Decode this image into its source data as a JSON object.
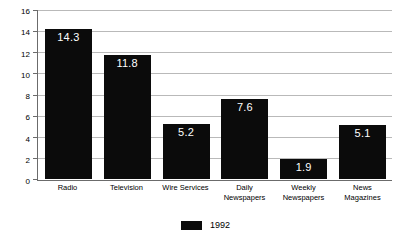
{
  "chart_data": {
    "type": "bar",
    "title": "",
    "subtitle": "",
    "xlabel": "",
    "ylabel": "",
    "categories": [
      "Radio",
      "Television",
      "Wire Services",
      "Daily Newspapers",
      "Weekly Newspapers",
      "News Magazines"
    ],
    "category_lines": [
      [
        "Radio"
      ],
      [
        "Television"
      ],
      [
        "Wire Services"
      ],
      [
        "Daily",
        "Newspapers"
      ],
      [
        "Weekly",
        "Newspapers"
      ],
      [
        "News",
        "Magazines"
      ]
    ],
    "series": [
      {
        "name": "1992",
        "color": "#0b0b0b",
        "values": [
          14.3,
          11.8,
          5.2,
          7.6,
          1.9,
          5.1
        ],
        "value_labels": [
          "14.3",
          "11.8",
          "5.2",
          "7.6",
          "1.9",
          "5.1"
        ]
      }
    ],
    "ylim": [
      0,
      16
    ],
    "ytick_step": 2,
    "yticks": [
      0,
      2,
      4,
      6,
      8,
      10,
      12,
      14,
      16
    ],
    "ytick_labels": [
      "0",
      "2",
      "4",
      "6",
      "8",
      "10",
      "12",
      "14",
      "16"
    ],
    "grid": true,
    "grid_axis": "y",
    "grid_color": "#b9b9b9",
    "axis_color": "#6b6b6b",
    "bar_label_color": "#ffffff",
    "legend": {
      "position": "bottom-center",
      "entries": [
        {
          "label": "1992",
          "color": "#0b0b0b"
        }
      ]
    }
  }
}
